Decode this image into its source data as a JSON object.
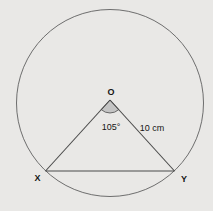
{
  "figure": {
    "labels": {
      "center": "O",
      "angle": "105°",
      "radius": "10 cm",
      "vertex_left": "X",
      "vertex_right": "Y"
    },
    "colors": {
      "background": "#e9e8e6",
      "circle_stroke": "#6e6e6e",
      "line_stroke": "#4a4a4a",
      "sector_fill": "#c4c4c4",
      "sector_stroke": "#5a5a5a",
      "text": "#141414"
    }
  }
}
